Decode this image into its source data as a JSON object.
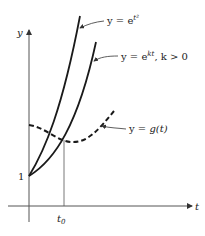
{
  "axes": {
    "x_label": "t",
    "y_label": "y",
    "y_tick_label": "1",
    "x_marker_label": "t",
    "x_marker_sub": "0"
  },
  "curves": [
    {
      "name": "exp-t-squared",
      "label_prefix": "y = e",
      "label_sup": "t²",
      "label_suffix": "",
      "style": "solid"
    },
    {
      "name": "exp-kt",
      "label_prefix": "y = e",
      "label_sup": "kt",
      "label_suffix": ", k > 0",
      "style": "solid"
    },
    {
      "name": "g-of-t",
      "label_prefix": "y = ",
      "label_fn": "g(t)",
      "style": "dashed"
    }
  ],
  "colors": {
    "ink": "#1a1a1a",
    "axis": "#555555",
    "background": "#ffffff"
  }
}
